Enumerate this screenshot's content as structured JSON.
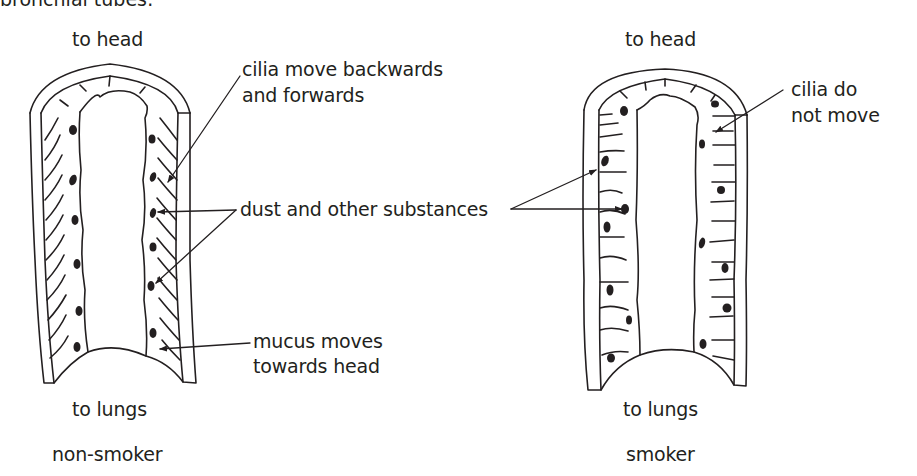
{
  "header": {
    "cut_off_text": "bronchial tubes:"
  },
  "left_panel": {
    "top_label": "to head",
    "bottom_label": "to lungs",
    "caption": "non-smoker",
    "annotations": {
      "cilia": [
        "cilia move backwards",
        "and forwards"
      ],
      "mucus": [
        "mucus moves",
        "towards head"
      ]
    }
  },
  "shared_annotation": {
    "dust": "dust and other substances"
  },
  "right_panel": {
    "top_label": "to head",
    "bottom_label": "to lungs",
    "caption": "smoker",
    "annotations": {
      "cilia": [
        "cilia do",
        "not move"
      ]
    }
  },
  "colors": {
    "ink": "#231f20",
    "background": "#ffffff"
  }
}
